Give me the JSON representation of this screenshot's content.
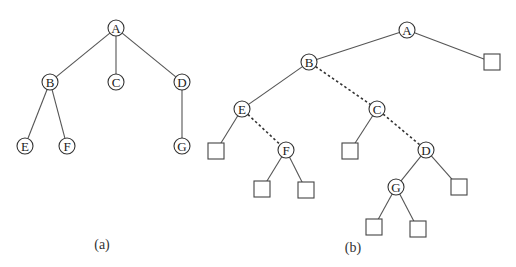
{
  "figure_a": {
    "caption": "(a)",
    "nodes": [
      {
        "id": "A",
        "label": "A",
        "x": 116,
        "y": 28
      },
      {
        "id": "B",
        "label": "B",
        "x": 50,
        "y": 82
      },
      {
        "id": "C",
        "label": "C",
        "x": 116,
        "y": 82
      },
      {
        "id": "D",
        "label": "D",
        "x": 182,
        "y": 82
      },
      {
        "id": "E",
        "label": "E",
        "x": 25,
        "y": 146
      },
      {
        "id": "F",
        "label": "F",
        "x": 67,
        "y": 146
      },
      {
        "id": "G",
        "label": "G",
        "x": 182,
        "y": 146
      }
    ],
    "edges": [
      [
        "A",
        "B"
      ],
      [
        "A",
        "C"
      ],
      [
        "A",
        "D"
      ],
      [
        "B",
        "E"
      ],
      [
        "B",
        "F"
      ],
      [
        "D",
        "G"
      ]
    ]
  },
  "figure_b": {
    "caption": "(b)",
    "nodes": [
      {
        "id": "A",
        "label": "A",
        "x": 407,
        "y": 30
      },
      {
        "id": "B",
        "label": "B",
        "x": 309,
        "y": 62
      },
      {
        "id": "E",
        "label": "E",
        "x": 242,
        "y": 109
      },
      {
        "id": "C",
        "label": "C",
        "x": 377,
        "y": 109
      },
      {
        "id": "F",
        "label": "F",
        "x": 286,
        "y": 150
      },
      {
        "id": "D",
        "label": "D",
        "x": 426,
        "y": 150
      },
      {
        "id": "G",
        "label": "G",
        "x": 396,
        "y": 187
      }
    ],
    "leaves": [
      {
        "id": "nA",
        "x": 492,
        "y": 62
      },
      {
        "id": "nE",
        "x": 216,
        "y": 151
      },
      {
        "id": "nF1",
        "x": 262,
        "y": 189
      },
      {
        "id": "nF2",
        "x": 306,
        "y": 190
      },
      {
        "id": "nC",
        "x": 350,
        "y": 151
      },
      {
        "id": "nD",
        "x": 459,
        "y": 187
      },
      {
        "id": "nG1",
        "x": 374,
        "y": 227
      },
      {
        "id": "nG2",
        "x": 418,
        "y": 229
      }
    ],
    "edges": [
      {
        "from": "A",
        "to": "B",
        "style": "solid"
      },
      {
        "from": "A",
        "to": "nA",
        "style": "solid"
      },
      {
        "from": "B",
        "to": "E",
        "style": "solid"
      },
      {
        "from": "B",
        "to": "C",
        "style": "dashed"
      },
      {
        "from": "E",
        "to": "nE",
        "style": "solid"
      },
      {
        "from": "E",
        "to": "F",
        "style": "dashed"
      },
      {
        "from": "F",
        "to": "nF1",
        "style": "solid"
      },
      {
        "from": "F",
        "to": "nF2",
        "style": "solid"
      },
      {
        "from": "C",
        "to": "nC",
        "style": "solid"
      },
      {
        "from": "C",
        "to": "D",
        "style": "dashed"
      },
      {
        "from": "D",
        "to": "G",
        "style": "solid"
      },
      {
        "from": "D",
        "to": "nD",
        "style": "solid"
      },
      {
        "from": "G",
        "to": "nG1",
        "style": "solid"
      },
      {
        "from": "G",
        "to": "nG2",
        "style": "solid"
      }
    ]
  }
}
